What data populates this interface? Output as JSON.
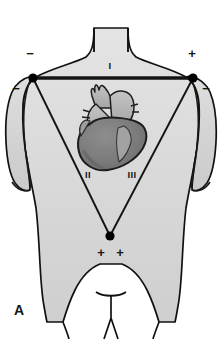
{
  "figure": {
    "panel_label": "A",
    "title_alt": "Einthoven's triangle on anterior thorax",
    "background_color": "#ffffff"
  },
  "body_illustration": {
    "name": "male-torso-anterior",
    "fill_color": "#d7d7d7",
    "outline_color": "#101010",
    "shading_color": "#c2c2c2"
  },
  "heart": {
    "name": "heart-anterior",
    "ventricle_color": "#7a7a7a",
    "vessel_color": "#b3b3b3",
    "outline_color": "#1a1a1a",
    "highlight_color": "#9a9a9a"
  },
  "triangle": {
    "line_color": "#141414",
    "electrode_color": "#000000",
    "leads": [
      {
        "id": "lead-i",
        "label": "I",
        "label_x": 110,
        "label_y": 69
      },
      {
        "id": "lead-ii",
        "label": "II",
        "label_x": 88,
        "label_y": 176
      },
      {
        "id": "lead-iii",
        "label": "III",
        "label_x": 131,
        "label_y": 176
      }
    ],
    "electrodes": [
      {
        "id": "electrode-right-arm",
        "cx": 33,
        "cy": 78,
        "r": 4.6
      },
      {
        "id": "electrode-left-arm",
        "cx": 193,
        "cy": 78,
        "r": 4.6
      },
      {
        "id": "electrode-left-leg",
        "cx": 110,
        "cy": 236,
        "r": 4.6
      }
    ],
    "polarity_marks": [
      {
        "id": "polarity-ra-upper",
        "symbol": "−",
        "x": 30,
        "y": 55
      },
      {
        "id": "polarity-ra-lower",
        "symbol": "−",
        "x": 16,
        "y": 90
      },
      {
        "id": "polarity-la-upper",
        "symbol": "+",
        "x": 190,
        "y": 55
      },
      {
        "id": "polarity-la-lower",
        "symbol": "−",
        "x": 205,
        "y": 90
      },
      {
        "id": "polarity-ll-left",
        "symbol": "+",
        "x": 100,
        "y": 253
      },
      {
        "id": "polarity-ll-right",
        "symbol": "+",
        "x": 119,
        "y": 253
      }
    ]
  }
}
